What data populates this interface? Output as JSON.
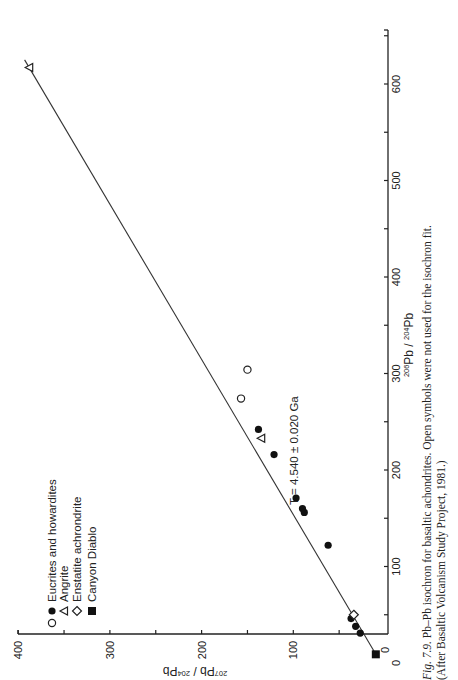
{
  "figure": {
    "caption_label": "Fig. 7.9.",
    "caption_line1": "Pb–Pb isochron for basaltic achondrites. Open symbols were not used for the isochron fit.",
    "caption_line2": "(After Basaltic Volcanism Study Project, 1981.)",
    "annotation": "T = 4.540 ± 0.020 Ga"
  },
  "chart_data": {
    "type": "scatter",
    "title": "Pb–Pb isochron for basaltic achondrites",
    "xlabel": "206Pb / 204Pb",
    "ylabel": "207Pb / 204Pb",
    "xlim": [
      0,
      650
    ],
    "ylim": [
      0,
      400
    ],
    "x_ticks": [
      0,
      100,
      200,
      300,
      400,
      500,
      600
    ],
    "y_ticks": [
      0,
      100,
      200,
      300,
      400
    ],
    "rotation": "figure rotated 90° counter-clockwise on page",
    "legend": [
      {
        "symbol": "open-circle + filled-circle",
        "label": "Eucrites and howardites"
      },
      {
        "symbol": "open-triangle",
        "label": "Angrite"
      },
      {
        "symbol": "open-diamond",
        "label": "Enstatite achrondrite"
      },
      {
        "symbol": "filled-square",
        "label": "Canyon Diablo"
      }
    ],
    "annotation": "T = 4.540 ± 0.020 Ga",
    "series": [
      {
        "name": "Eucrites and howardites (fit)",
        "marker": "filled-circle",
        "points": [
          [
            31,
            27
          ],
          [
            38,
            32
          ],
          [
            46,
            37
          ],
          [
            122,
            62
          ],
          [
            156,
            88
          ],
          [
            160,
            90
          ],
          [
            171,
            97
          ],
          [
            216,
            121
          ],
          [
            242,
            138
          ]
        ]
      },
      {
        "name": "Eucrites and howardites (not fit)",
        "marker": "open-circle",
        "points": [
          [
            274,
            157
          ],
          [
            304,
            150
          ]
        ]
      },
      {
        "name": "Angrite",
        "marker": "open-triangle",
        "points": [
          [
            233,
            135
          ],
          [
            617,
            388
          ]
        ]
      },
      {
        "name": "Enstatite achrondrite",
        "marker": "open-diamond",
        "points": [
          [
            50,
            34
          ]
        ]
      },
      {
        "name": "Canyon Diablo",
        "marker": "filled-square",
        "points": [
          [
            9,
            10
          ]
        ]
      }
    ],
    "fit_line": {
      "from": [
        9,
        10
      ],
      "to": [
        625,
        393
      ]
    }
  }
}
